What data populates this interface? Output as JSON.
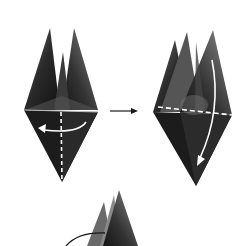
{
  "diagram": {
    "type": "origami-instructions",
    "colors": {
      "paper_dark": "#1e1e1e",
      "paper_mid": "#4a4a4a",
      "paper_light": "#7a7a7a",
      "arrow": "#1a1a1a",
      "fold_line": "#ffffff",
      "background": "#ffffff"
    },
    "steps": [
      {
        "id": "step-a",
        "description": "model with valley fold line, curved arrow turning flap right-to-left"
      },
      {
        "id": "step-b",
        "description": "model with horizontal dashed fold line, curved arrow folding down"
      },
      {
        "id": "step-c",
        "description": "next model with curved arrow (partially visible)"
      }
    ],
    "transition_arrow": {
      "direction": "right",
      "from": "step-a",
      "to": "step-b"
    }
  }
}
